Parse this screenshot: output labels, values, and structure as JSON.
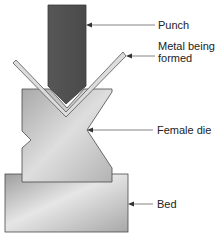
{
  "diagram": {
    "labels": {
      "punch": "Punch",
      "metal_line1": "Metal being",
      "metal_line2": "formed",
      "female_die": "Female die",
      "bed": "Bed"
    },
    "components": [
      {
        "id": "punch",
        "shape": "rectangle with V tip",
        "fill": "#5a5a5a"
      },
      {
        "id": "metal-sheet",
        "shape": "V-bent strip",
        "fill": "#d8d8d8"
      },
      {
        "id": "female-die",
        "shape": "block with V groove and side notches",
        "fill": "#bdbdbd"
      },
      {
        "id": "bed",
        "shape": "rectangle",
        "fill": "#b5b5b5"
      }
    ],
    "colors": {
      "punch": "#5a5a5a",
      "die": "#bdbdbd",
      "bed": "#b5b5b5",
      "sheet": "#dcdcdc",
      "outline": "#444444",
      "leader": "#555555",
      "text": "#222222"
    }
  }
}
